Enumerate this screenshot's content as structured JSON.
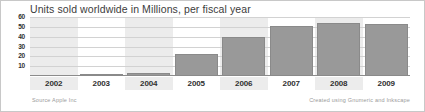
{
  "chart_data": {
    "type": "bar",
    "title": "Units sold worldwide in Millions, per fiscal year",
    "xlabel": "",
    "ylabel": "",
    "categories": [
      "2002",
      "2003",
      "2004",
      "2005",
      "2006",
      "2007",
      "2008",
      "2009"
    ],
    "values": [
      0,
      0.6,
      3,
      22,
      39.5,
      51,
      54,
      53
    ],
    "yticks": [
      60,
      50,
      40,
      30,
      20,
      10
    ],
    "ylim": [
      0,
      60
    ],
    "grid": true,
    "legend": false,
    "bar_color": "#999999",
    "band_color": "#e6e6e6",
    "banded_categories": [
      "2002",
      "2004",
      "2006",
      "2008"
    ]
  },
  "footer": {
    "source": "Source Apple Inc",
    "credit": "Created using Gnumeric and Inkscape"
  }
}
